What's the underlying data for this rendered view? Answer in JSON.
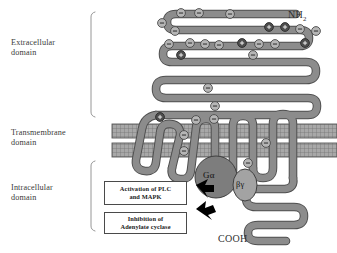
{
  "figure": {
    "type": "diagram",
    "background_color": "#ffffff"
  },
  "domain_labels": {
    "extracellular": "Extracellular\ndomain",
    "transmembrane": "Transmembrane\ndomain",
    "intracellular": "Intracellular\ndomain"
  },
  "terminals": {
    "n_terminus_text": "NH",
    "n_terminus_subscript": "2",
    "c_terminus": "COOH"
  },
  "g_protein": {
    "alpha_label": "Gα",
    "beta_gamma_label": "βγ",
    "alpha_color": "#7d7d7d",
    "beta_gamma_color": "#a3a3a3"
  },
  "signal_boxes": [
    {
      "id": "activation",
      "text": "Activation of PLC\nand MAPK"
    },
    {
      "id": "inhibition",
      "text": "Inhibition of\nAdenylate cyclase"
    }
  ],
  "colors": {
    "ribbon_fill": "#8c8c8c",
    "ribbon_stroke": "#4f4f4f",
    "membrane_fill": "#9a9a9a",
    "membrane_stroke": "#5a5a5a",
    "residue_negative_fill": "#b3b3b3",
    "residue_positive_fill": "#4d4d4d",
    "arrow_fill": "#000000",
    "bracket_stroke": "#7a7a7a",
    "text_color": "#2f2f2f"
  },
  "residues": {
    "negative_symbol": "–",
    "positive_symbol": "+",
    "negative_count": 22,
    "positive_count": 6
  },
  "membrane": {
    "band_count": 2,
    "hatch_pattern": "fine grid"
  }
}
